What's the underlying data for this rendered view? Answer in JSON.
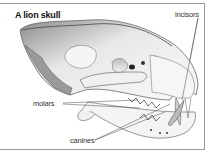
{
  "figure": {
    "title": "A lion skull",
    "labels": {
      "incisors": "incisors",
      "molars": "molars",
      "canines": "canines"
    }
  }
}
